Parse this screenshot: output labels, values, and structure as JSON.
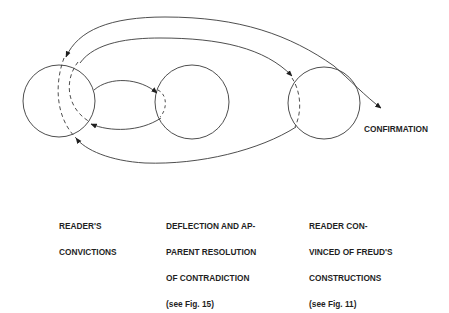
{
  "diagram": {
    "type": "flow-diagram",
    "nodes": [
      {
        "id": "readers-convictions",
        "label_lines": [
          "READER'S",
          "CONVICTIONS"
        ]
      },
      {
        "id": "deflection",
        "label_lines": [
          "DEFLECTION AND AP-",
          "PARENT RESOLUTION",
          "OF CONTRADICTION",
          "(see Fig. 15)"
        ]
      },
      {
        "id": "reader-convinced",
        "label_lines": [
          "READER CON-",
          "VINCED OF FREUD'S",
          "CONSTRUCTIONS",
          "(see Fig. 11)"
        ]
      }
    ],
    "outcome_label": "CONFIRMATION",
    "edges": [
      {
        "from": "reader-convinced",
        "to": "readers-convictions",
        "style": "outer arc top"
      },
      {
        "from": "readers-convictions",
        "to": "reader-convinced",
        "style": "inner arc top"
      },
      {
        "from": "readers-convictions",
        "to": "deflection",
        "style": "arc"
      },
      {
        "from": "deflection",
        "to": "readers-convictions",
        "style": "arc"
      },
      {
        "from": "reader-convinced",
        "to": "readers-convictions",
        "style": "bottom arc"
      },
      {
        "from": "reader-convinced",
        "to": "confirmation",
        "style": "straight"
      }
    ],
    "line_color": "#3a3a3a"
  }
}
